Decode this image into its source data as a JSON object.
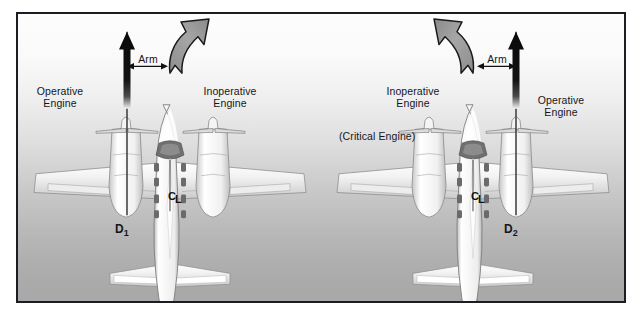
{
  "figure": {
    "background_top_color": "#fdfdfd",
    "background_bottom_color": "#a8a8a8",
    "border_color": "#1c1c22"
  },
  "panels": [
    {
      "id": "left-panel",
      "name": "right-engine-inoperative-diagram",
      "labels": {
        "operative_engine": "Operative\nEngine",
        "operative_engine_line1": "Operative",
        "operative_engine_line2": "Engine",
        "inoperative_engine_line1": "Inoperative",
        "inoperative_engine_line2": "Engine",
        "arm": "Arm",
        "moment_arm_symbol": "D",
        "moment_arm_subscript": "1",
        "centerline_c": "C",
        "centerline_l": "L"
      },
      "thrust_arrow": {
        "name": "thrust-vector-arrow",
        "direction": "up",
        "side": "left-engine",
        "color": "#0d0d0d"
      },
      "yaw_arrow": {
        "name": "yaw-moment-arrow",
        "direction": "up-right",
        "color": "#9a9a9a"
      }
    },
    {
      "id": "right-panel",
      "name": "left-engine-inoperative-diagram",
      "labels": {
        "inoperative_engine_line1": "Inoperative",
        "inoperative_engine_line2": "Engine",
        "critical_engine": "(Critical Engine)",
        "operative_engine_line1": "Operative",
        "operative_engine_line2": "Engine",
        "arm": "Arm",
        "moment_arm_symbol": "D",
        "moment_arm_subscript": "2",
        "centerline_c": "C",
        "centerline_l": "L"
      },
      "thrust_arrow": {
        "name": "thrust-vector-arrow",
        "direction": "up",
        "side": "right-engine",
        "color": "#0d0d0d"
      },
      "yaw_arrow": {
        "name": "yaw-moment-arrow",
        "direction": "up-left",
        "color": "#9a9a9a"
      }
    }
  ],
  "colors": {
    "arrow_black": "#0d0d0d",
    "arrow_gray_fill": "#9b9b9b",
    "arrow_gray_stroke": "#1a1a1a",
    "airframe_light": "#f7f7f7",
    "airframe_mid": "#d4d4d4",
    "airframe_dark": "#6e6e6e",
    "text": "#16161a"
  }
}
